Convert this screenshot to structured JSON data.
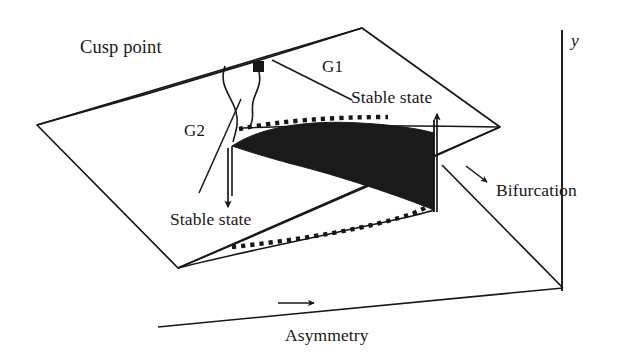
{
  "figure": {
    "type": "diagram",
    "background_color": "#ffffff",
    "ink_color": "#171717",
    "width": 621,
    "height": 361
  },
  "labels": {
    "cusp_point": "Cusp point",
    "g1": "G1",
    "g2": "G2",
    "stable_state_upper": "Stable state",
    "stable_state_lower": "Stable state",
    "bifurcation": "Bifurcation",
    "asymmetry": "Asymmetry",
    "y_axis": "y"
  },
  "icons": {
    "control_point_marker": "filled-square-marker",
    "arrow_up": "arrow-up-icon",
    "arrow_down": "arrow-down-icon",
    "arrow_right": "arrow-right-icon",
    "arrow_diagonal": "arrow-down-right-icon"
  },
  "geometry": {
    "control_surface_polygon": "37,125 362,28 500,127 178,268",
    "fold_region_fill": "#1a1a1a",
    "upper_fold_dotted": true,
    "lower_fold_dotted": true,
    "cusp_tip": "232,146",
    "fold_right_edge": "434,210",
    "marker_position": "253,61",
    "asymmetry_axis": "158,327 to 563,288",
    "y_axis_line": "562,30 to 562,291",
    "bifurcation_diagonal": "442,165 to 563,288"
  },
  "annotations": {
    "stable_state_upper_arrow": "points up toward the upper sheet of the surface",
    "stable_state_lower_arrow": "points down toward the lower sheet of the surface",
    "asymmetry_arrow": "points right along the asymmetry axis",
    "bifurcation_arrow": "points down-right toward the bifurcation set"
  }
}
